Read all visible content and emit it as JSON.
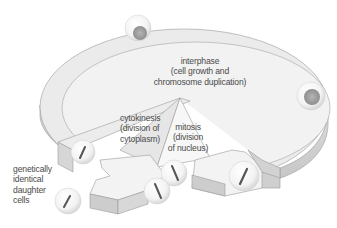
{
  "diagram": {
    "colors": {
      "ring_top": "#ebebeb",
      "ring_inner": "#f1f1f1",
      "ring_side": "#d3d3d3",
      "ring_outline": "#9a9a9a",
      "arrow_face": "#f4f4f4",
      "arrow_side": "#cfcfcf",
      "cell_body": "#f6f6f6",
      "nucleus": "#a8a8a8",
      "chromosome": "#555555",
      "text": "#4a4a4a"
    },
    "labels": {
      "interphase": {
        "line1": "interphase",
        "line2": "(cell growth and",
        "line3": "chromosome duplication)"
      },
      "cytokinesis": {
        "line1": "cytokinesis",
        "line2": "(division of",
        "line3": "cytoplasm)"
      },
      "mitosis": {
        "line1": "mitosis",
        "line2": "(division",
        "line3": "of nucleus)"
      },
      "daughter_cells": {
        "line1": "genetically",
        "line2": "identical",
        "line3": "daughter",
        "line4": "cells"
      }
    },
    "nodes": [
      {
        "id": "interphase",
        "label": "interphase (cell growth and chromosome duplication)"
      },
      {
        "id": "mitosis",
        "label": "mitosis (division of nucleus)"
      },
      {
        "id": "cytokinesis",
        "label": "cytokinesis (division of cytoplasm)"
      },
      {
        "id": "daughter_cells",
        "label": "genetically identical daughter cells"
      }
    ],
    "edges": [
      {
        "from": "interphase",
        "to": "mitosis"
      },
      {
        "from": "mitosis",
        "to": "cytokinesis"
      },
      {
        "from": "cytokinesis",
        "to": "daughter_cells"
      },
      {
        "from": "cytokinesis",
        "to": "interphase"
      }
    ],
    "cells": [
      {
        "stage": "interphase-top",
        "type": "nucleus"
      },
      {
        "stage": "interphase-right",
        "type": "nucleus"
      },
      {
        "stage": "mitosis",
        "type": "chromosome"
      },
      {
        "stage": "mitosis-split-1",
        "type": "chromosome"
      },
      {
        "stage": "mitosis-split-2",
        "type": "chromosome"
      },
      {
        "stage": "cytokinesis",
        "type": "chromosome"
      },
      {
        "stage": "daughter",
        "type": "chromosome"
      }
    ]
  }
}
